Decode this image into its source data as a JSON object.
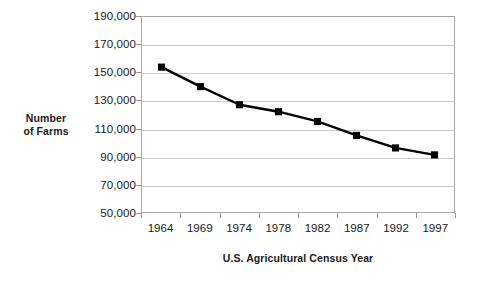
{
  "chart_data": {
    "type": "line",
    "title": "",
    "xlabel": "U.S. Agricultural Census Year",
    "ylabel": "Number of Farms",
    "ylabel_lines": [
      "Number",
      "of Farms"
    ],
    "categories": [
      "1964",
      "1969",
      "1974",
      "1978",
      "1982",
      "1987",
      "1992",
      "1997"
    ],
    "values": [
      154000,
      140000,
      127000,
      122000,
      115000,
      105000,
      96000,
      91000
    ],
    "series": [
      {
        "name": "Number of Farms",
        "values": [
          154000,
          140000,
          127000,
          122000,
          115000,
          105000,
          96000,
          91000
        ]
      }
    ],
    "ylim": [
      50000,
      190000
    ],
    "ytick_values": [
      190000,
      170000,
      150000,
      130000,
      110000,
      90000,
      70000,
      50000
    ],
    "ytick_labels": [
      "190,000",
      "170,000",
      "150,000",
      "130,000",
      "110,000",
      "90,000",
      "70,000",
      "50,000"
    ],
    "grid": true,
    "legend": "none",
    "marker": "square",
    "line_color": "#000000",
    "marker_color": "#000000",
    "grid_color": "#c9c9c9",
    "axis_color": "#a8a8a8",
    "background_color": "#ffffff"
  }
}
